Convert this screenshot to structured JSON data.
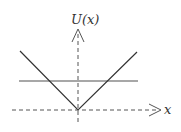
{
  "diagram": {
    "y_axis_label": "U(x)",
    "x_axis_label": "x",
    "colors": {
      "axes": "#555555",
      "potential": "#333333",
      "energy_level": "#888888",
      "background": "#ffffff"
    },
    "elements": [
      {
        "type": "axis",
        "name": "x-axis",
        "style": "dashed",
        "arrow": "right"
      },
      {
        "type": "axis",
        "name": "y-axis",
        "style": "dashed",
        "arrow": "up"
      },
      {
        "type": "curve",
        "name": "potential-v",
        "shape": "V",
        "vertex_at_origin": true
      },
      {
        "type": "line",
        "name": "energy-level",
        "orientation": "horizontal"
      }
    ]
  }
}
